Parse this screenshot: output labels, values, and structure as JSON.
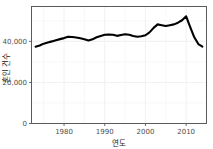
{
  "chart_data": {
    "type": "line",
    "title": "",
    "xlabel": "연도",
    "ylabel": "혼인 건수",
    "xlim": [
      1972,
      2015
    ],
    "ylim": [
      0,
      57000
    ],
    "grid": true,
    "legend": "none",
    "xticks": [
      1980,
      1990,
      2000,
      2010
    ],
    "xticklabels": [
      "1980",
      "1990",
      "2000",
      "2010"
    ],
    "yticks": [
      0,
      20000,
      40000
    ],
    "yticklabels": [
      "0",
      "20,000",
      "40,000"
    ],
    "line_color": "#000000",
    "line_width": 2.1,
    "panel_background": "#ffffff",
    "panel_border_color": "#5a5a5a",
    "gridline_color": "#f2f2f2",
    "x": [
      1973,
      1974,
      1975,
      1976,
      1977,
      1978,
      1979,
      1980,
      1981,
      1982,
      1983,
      1984,
      1985,
      1986,
      1987,
      1988,
      1989,
      1990,
      1991,
      1992,
      1993,
      1994,
      1995,
      1996,
      1997,
      1998,
      1999,
      2000,
      2001,
      2002,
      2003,
      2004,
      2005,
      2006,
      2007,
      2008,
      2009,
      2010,
      2011,
      2012,
      2013,
      2014
    ],
    "values": [
      37400,
      38000,
      38900,
      39500,
      40000,
      40600,
      41100,
      41600,
      42300,
      42100,
      41900,
      41500,
      41000,
      40400,
      41000,
      42000,
      42600,
      43200,
      43400,
      43200,
      42700,
      43100,
      43500,
      43200,
      42600,
      42300,
      42500,
      43000,
      44400,
      46600,
      48300,
      47900,
      47500,
      47900,
      48300,
      49100,
      50300,
      52200,
      47000,
      42000,
      38700,
      37500
    ]
  },
  "axis_titles": {
    "x": "연도",
    "y": "혼인 건수"
  }
}
